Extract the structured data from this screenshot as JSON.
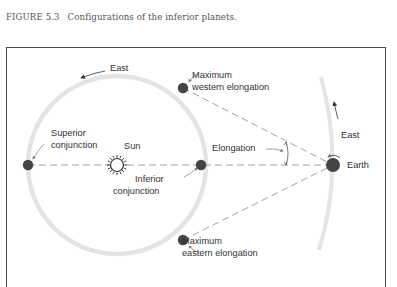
{
  "caption": {
    "figure_number": "FIGURE 5.3",
    "text": "Configurations of the inferior planets."
  },
  "diagram": {
    "labels": {
      "east_inner": "East",
      "max_western_line1": "Maximum",
      "max_western_line2": "western elongation",
      "superior_line1": "Superior",
      "superior_line2": "conjunction",
      "sun": "Sun",
      "elongation": "Elongation",
      "inferior_line1": "Inferior",
      "inferior_line2": "conjunction",
      "east_outer": "East",
      "earth": "Earth",
      "max_eastern_line1": "Maximum",
      "max_eastern_line2": "eastern elongation"
    },
    "colors": {
      "orbit": "#e2e2e2",
      "planet": "#444444",
      "line": "#8a8a8a",
      "frame": "#4a4a4a"
    }
  }
}
